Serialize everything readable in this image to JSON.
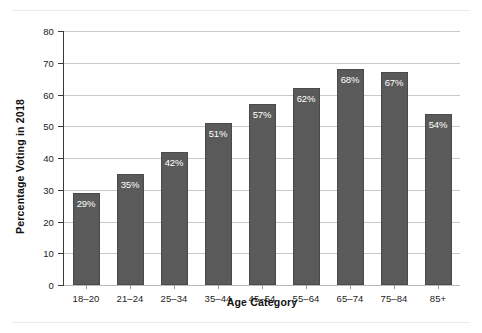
{
  "chart_data": {
    "type": "bar",
    "title": "",
    "xlabel": "Age Category",
    "ylabel": "Percentage Voting in 2018",
    "categories": [
      "18–20",
      "21–24",
      "25–34",
      "35–44",
      "45–54",
      "55–64",
      "65–74",
      "75–84",
      "85+"
    ],
    "values": [
      29,
      35,
      42,
      51,
      57,
      62,
      68,
      67,
      54
    ],
    "value_labels": [
      "29%",
      "35%",
      "42%",
      "51%",
      "57%",
      "62%",
      "68%",
      "67%",
      "54%"
    ],
    "ylim": [
      0,
      80
    ],
    "yticks": [
      0,
      10,
      20,
      30,
      40,
      50,
      60,
      70,
      80
    ],
    "ytick_labels": [
      "0",
      "10",
      "20",
      "30",
      "40",
      "50",
      "60",
      "70",
      "80"
    ],
    "grid": true,
    "legend": "none",
    "bar_color": "#5a5a5a",
    "bar_label_color": "#ffffff",
    "gridline_color": "#c9c9c9",
    "axis_color": "#3a3a3a",
    "background_color": "#ffffff"
  }
}
